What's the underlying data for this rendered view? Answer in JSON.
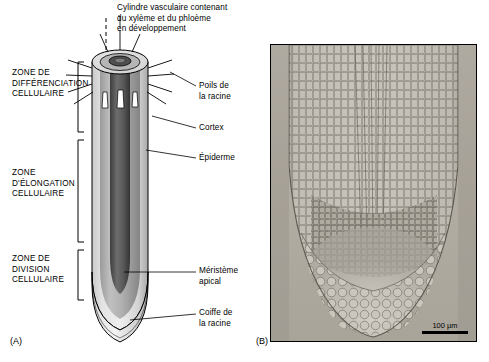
{
  "figure": {
    "panel_a_letter": "(A)",
    "panel_b_letter": "(B)"
  },
  "labels": {
    "vascular_cylinder": "Cylindre vasculaire contenant\ndu xylème et du phloème\nen développement",
    "root_hairs": "Poils de\nla racine",
    "cortex": "Cortex",
    "epidermis": "Épiderme",
    "apical_meristem": "Méristème\napical",
    "root_cap": "Coiffe de\nla racine"
  },
  "zones": {
    "differentiation": "ZONE DE\nDIFFÉRENCIATION\nCELLULAIRE",
    "elongation": "ZONE\nD'ÉLONGATION\nCELLULAIRE",
    "division": "ZONE DE\nDIVISION\nCELLULAIRE"
  },
  "micrograph": {
    "scale_label": "100 µm"
  },
  "colors": {
    "outline": "#000000",
    "root_body_light": "#d8d8d8",
    "root_body_mid": "#9a9a9a",
    "vascular_dark": "#4a4a4a",
    "micro_bg": "#b7b2a9"
  }
}
